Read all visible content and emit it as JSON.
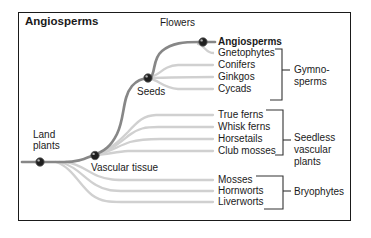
{
  "figure": {
    "title": "Angiosperms",
    "node_labels": {
      "flowers": "Flowers",
      "seeds": "Seeds",
      "land_plants": "Land plants",
      "vascular_tissue": "Vascular tissue"
    },
    "tips": [
      {
        "label": "Angiosperms",
        "bold": true,
        "group": ""
      },
      {
        "label": "Gnetophytes",
        "bold": false,
        "group": "Gymnosperms"
      },
      {
        "label": "Conifers",
        "bold": false,
        "group": "Gymnosperms"
      },
      {
        "label": "Ginkgos",
        "bold": false,
        "group": "Gymnosperms"
      },
      {
        "label": "Cycads",
        "bold": false,
        "group": "Gymnosperms"
      },
      {
        "label": "True ferns",
        "bold": false,
        "group": "Seedless vascular plants"
      },
      {
        "label": "Whisk ferns",
        "bold": false,
        "group": "Seedless vascular plants"
      },
      {
        "label": "Horsetails",
        "bold": false,
        "group": "Seedless vascular plants"
      },
      {
        "label": "Club mosses",
        "bold": false,
        "group": "Seedless vascular plants"
      },
      {
        "label": "Mosses",
        "bold": false,
        "group": "Bryophytes"
      },
      {
        "label": "Hornworts",
        "bold": false,
        "group": "Bryophytes"
      },
      {
        "label": "Liverworts",
        "bold": false,
        "group": "Bryophytes"
      }
    ],
    "groups": [
      {
        "name": "Gymnosperms",
        "lines": [
          "Gymno-",
          "sperms"
        ]
      },
      {
        "name": "Seedless vascular plants",
        "lines": [
          "Seedless",
          "vascular",
          "plants"
        ]
      },
      {
        "name": "Bryophytes",
        "lines": [
          "Bryophytes"
        ]
      }
    ],
    "colors": {
      "trunk": "#878787",
      "branch": "#d0d0d0",
      "node": "#1f1f1f",
      "bracket": "#333333",
      "border": "#1a1a1a",
      "text": "#1a1a1a"
    }
  }
}
